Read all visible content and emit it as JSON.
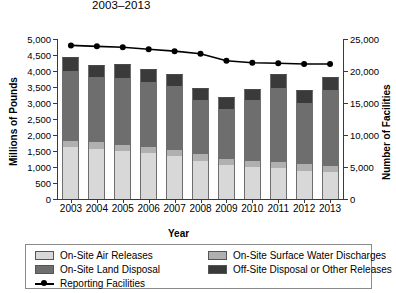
{
  "title": "2003–2013",
  "axes": {
    "left_title": "Millions of Pounds",
    "right_title": "Number of Facilities",
    "x_title": "Year"
  },
  "legend": {
    "items": [
      {
        "label": "On-Site Air Releases",
        "color": "#d8d8d8",
        "key": "air"
      },
      {
        "label": "On-Site Land Disposal",
        "color": "#6e6e6e",
        "key": "land"
      },
      {
        "label": "Reporting Facilities",
        "color": "#000000",
        "key": "line"
      },
      {
        "label": "On-Site Surface Water Discharges",
        "color": "#b0b0b0",
        "key": "water"
      },
      {
        "label": "Off-Site Disposal or Other Releases",
        "color": "#3a3a3a",
        "key": "offsite"
      }
    ]
  },
  "chart_data": {
    "type": "bar",
    "title": "2003–2013",
    "xlabel": "Year",
    "ylabel": "Millions of Pounds",
    "y2label": "Number of Facilities",
    "ylim": [
      0,
      5000
    ],
    "y2lim": [
      0,
      25000
    ],
    "ytick_labels": [
      "5,000",
      "4,500",
      "4,000",
      "3,500",
      "3,000",
      "2,500",
      "2,000",
      "1,500",
      "1,000",
      "500",
      "0"
    ],
    "ytick_values": [
      5000,
      4500,
      4000,
      3500,
      3000,
      2500,
      2000,
      1500,
      1000,
      500,
      0
    ],
    "y2tick_labels": [
      "25,000",
      "20,000",
      "15,000",
      "10,000",
      "5,000",
      "0"
    ],
    "y2tick_values": [
      25000,
      20000,
      15000,
      10000,
      5000,
      0
    ],
    "grid": false,
    "legend_position": "bottom",
    "categories": [
      "2003",
      "2004",
      "2005",
      "2006",
      "2007",
      "2008",
      "2009",
      "2010",
      "2011",
      "2012",
      "2013"
    ],
    "series": [
      {
        "name": "On-Site Air Releases",
        "color": "#d8d8d8",
        "axis": "left",
        "stack": "releases",
        "values": [
          1620,
          1560,
          1500,
          1440,
          1340,
          1200,
          1060,
          1000,
          960,
          880,
          840
        ]
      },
      {
        "name": "On-Site Surface Water Discharges",
        "color": "#b0b0b0",
        "axis": "left",
        "stack": "releases",
        "values": [
          200,
          210,
          200,
          200,
          200,
          200,
          190,
          200,
          200,
          200,
          200
        ]
      },
      {
        "name": "On-Site Land Disposal",
        "color": "#6e6e6e",
        "axis": "left",
        "stack": "releases",
        "values": [
          2180,
          2030,
          2090,
          2010,
          1980,
          1700,
          1560,
          1900,
          2320,
          1920,
          2360
        ]
      },
      {
        "name": "Off-Site Disposal or Other Releases",
        "color": "#3a3a3a",
        "axis": "left",
        "stack": "releases",
        "values": [
          440,
          400,
          420,
          410,
          400,
          380,
          390,
          340,
          430,
          400,
          400
        ]
      }
    ],
    "line_series": {
      "name": "Reporting Facilities",
      "color": "#000000",
      "axis": "right",
      "marker": "circle",
      "values": [
        24000,
        23850,
        23700,
        23400,
        23100,
        22700,
        21600,
        21300,
        21200,
        21100,
        21100
      ]
    }
  }
}
